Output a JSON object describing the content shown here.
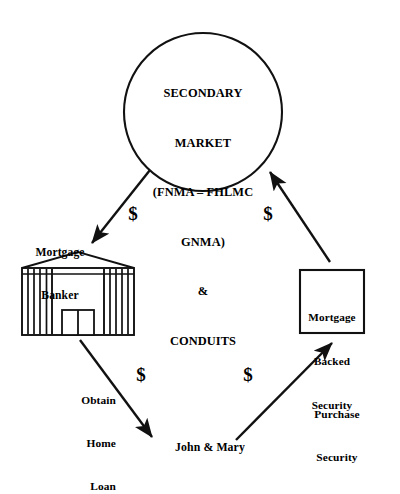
{
  "diagram": {
    "background_color": "#ffffff",
    "stroke_color": "#000000",
    "nodes": {
      "secondary_market": {
        "shape": "circle",
        "lines": [
          "SECONDARY",
          "MARKET",
          "(FNMA – FHLMC",
          "GNMA)",
          "&",
          "CONDUITS"
        ]
      },
      "mortgage_banker": {
        "shape": "bank-building",
        "lines": [
          "Mortgage",
          "Banker"
        ]
      },
      "mortgage_backed_security": {
        "shape": "rectangle",
        "lines": [
          "Mortgage",
          "Backed",
          "Security"
        ]
      },
      "borrower": {
        "shape": "text",
        "label": "John & Mary"
      }
    },
    "edges": [
      {
        "id": "secondary-to-banker",
        "from": "secondary_market",
        "to": "mortgage_banker",
        "direction": "down-left",
        "money_symbol": "$"
      },
      {
        "id": "mbs-to-secondary",
        "from": "mortgage_backed_security",
        "to": "secondary_market",
        "direction": "up-left",
        "money_symbol": "$"
      },
      {
        "id": "banker-to-borrower",
        "from": "mortgage_banker",
        "to": "borrower",
        "direction": "down-right",
        "money_symbol": "$",
        "lines": [
          "Obtain",
          "Home",
          "Loan"
        ]
      },
      {
        "id": "borrower-to-mbs",
        "from": "borrower",
        "to": "mortgage_backed_security",
        "direction": "up-right",
        "money_symbol": "$",
        "lines": [
          "Purchase",
          "Security"
        ]
      }
    ]
  }
}
